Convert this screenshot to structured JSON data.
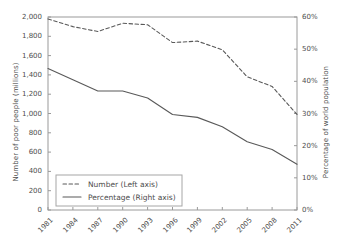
{
  "chart_data": {
    "type": "line",
    "title": "",
    "subtitle": "",
    "xlabel": "",
    "ylabel": "Number of poor people (millions)",
    "y2label": "Percentage of world population",
    "grid": false,
    "legend_position": "lower-left-inside",
    "x": [
      "1981",
      "1984",
      "1987",
      "1990",
      "1993",
      "1996",
      "1999",
      "2002",
      "2005",
      "2008",
      "2011"
    ],
    "categories": [
      "1981",
      "1984",
      "1987",
      "1990",
      "1993",
      "1996",
      "1999",
      "2002",
      "2005",
      "2008",
      "2011"
    ],
    "ylim": [
      0,
      2000
    ],
    "yticks": [
      0,
      200,
      400,
      600,
      800,
      1000,
      1200,
      1400,
      1600,
      1800,
      2000
    ],
    "ytick_labels": [
      "0",
      "200",
      "400",
      "600",
      "800",
      "1,000",
      "1,200",
      "1,400",
      "1,600",
      "1,800",
      "2,000"
    ],
    "y2lim": [
      0,
      60
    ],
    "y2ticks": [
      0,
      10,
      20,
      30,
      40,
      50,
      60
    ],
    "y2tick_labels": [
      "0%",
      "10%",
      "20%",
      "30%",
      "40%",
      "50%",
      "60%"
    ],
    "series": [
      {
        "name": "Number (Left axis)",
        "axis": "left",
        "style": "dashed",
        "color": "#595959",
        "values": [
          1980,
          1900,
          1850,
          1935,
          1920,
          1735,
          1750,
          1660,
          1380,
          1280,
          990
        ]
      },
      {
        "name": "Percentage (Right axis)",
        "axis": "right",
        "style": "solid",
        "color": "#595959",
        "values": [
          44.0,
          40.5,
          37.0,
          37.0,
          34.8,
          29.7,
          28.8,
          25.9,
          21.2,
          18.8,
          14.2
        ]
      }
    ]
  },
  "legend": {
    "items": [
      {
        "label": "Number (Left axis)",
        "style": "dashed"
      },
      {
        "label": "Percentage (Right axis)",
        "style": "solid"
      }
    ]
  },
  "colors": {
    "background": "#ffffff",
    "axis": "#9a9a9a",
    "text": "#4d4d4d",
    "line": "#595959",
    "legend_border": "#a6a6a6"
  }
}
